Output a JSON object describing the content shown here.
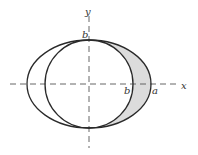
{
  "diagram": {
    "axes": {
      "x_label": "x",
      "y_label": "y"
    },
    "labels": {
      "b_top": "b",
      "b_right": "b",
      "a_right": "a"
    },
    "colors": {
      "stroke": "#2a2a2a",
      "axis": "#555555",
      "shade": "#dcdcdc",
      "background": "#ffffff"
    },
    "shapes": {
      "ellipse": {
        "cx": 89,
        "cy": 84,
        "rx": 62,
        "ry": 44
      },
      "circle": {
        "cx": 89,
        "cy": 84,
        "r": 44
      }
    }
  }
}
